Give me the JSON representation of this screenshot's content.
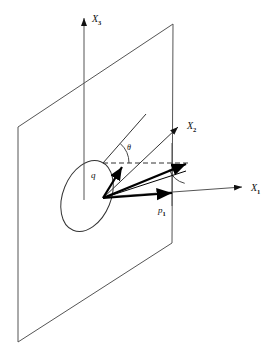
{
  "figure": {
    "background_color": "#ffffff",
    "line_color": "#444444",
    "vector_color": "#000000",
    "width": 276,
    "height": 361
  },
  "axes": [
    {
      "key": "x3",
      "name": "X3",
      "base": "X",
      "subscript": "3",
      "label_x": 92,
      "label_y": 22,
      "direction": "up",
      "from": [
        84,
        198
      ],
      "to": [
        84,
        14
      ],
      "arrow": true
    },
    {
      "key": "x2",
      "name": "X2",
      "base": "X",
      "subscript": "2",
      "label_x": 187,
      "label_y": 129,
      "direction": "up-right",
      "from": [
        103,
        198
      ],
      "to": [
        181,
        124
      ],
      "arrow": true
    },
    {
      "key": "x1",
      "name": "X1",
      "base": "X",
      "subscript": "1",
      "label_x": 253,
      "label_y": 191,
      "direction": "right",
      "from": [
        103,
        198
      ],
      "to": [
        246,
        187
      ],
      "arrow": true
    }
  ],
  "plane": {
    "name": "vertical-plane",
    "corners": [
      [
        18,
        127
      ],
      [
        173,
        24
      ],
      [
        172,
        243
      ],
      [
        18,
        342
      ]
    ],
    "stroke": "#555555",
    "fill": "none"
  },
  "ellipse": {
    "name": "origin-ellipse",
    "cx": 87,
    "cy": 196,
    "rx": 24,
    "ry": 37,
    "rotation_deg": 22,
    "stroke": "#333333"
  },
  "vectors": [
    {
      "key": "q",
      "label": "q",
      "label_x": 92,
      "label_y": 177,
      "from": [
        103,
        198
      ],
      "to": [
        124,
        164
      ],
      "weight": "thick",
      "arrow": true
    },
    {
      "key": "resultant",
      "label": "",
      "from": [
        103,
        198
      ],
      "to": [
        190,
        162
      ],
      "weight": "thick",
      "arrow": true
    },
    {
      "key": "p1",
      "label": "p1",
      "base": "p",
      "subscript": "1",
      "label_x": 160,
      "label_y": 212,
      "from": [
        103,
        198
      ],
      "to": [
        176,
        193
      ],
      "weight": "thick",
      "arrow": true
    },
    {
      "key": "secondary",
      "label": "",
      "from": [
        103,
        198
      ],
      "to": [
        186,
        171
      ],
      "weight": "thin",
      "arrow": false
    }
  ],
  "guides": [
    {
      "key": "dashed-horizontal",
      "name": "dashed-projection-line",
      "from": [
        103,
        163
      ],
      "to": [
        188,
        163
      ],
      "style": "dashed"
    },
    {
      "key": "theta-ray",
      "name": "theta-reference-ray",
      "from": [
        103,
        163
      ],
      "to": [
        146,
        114
      ],
      "style": "solid"
    },
    {
      "key": "vertical-drop",
      "name": "plane-right-edge-drop",
      "from": [
        172,
        143
      ],
      "to": [
        172,
        205
      ],
      "style": "solid"
    }
  ],
  "angles": [
    {
      "key": "theta",
      "label": "θ",
      "label_x": 129,
      "label_y": 148,
      "vertex": [
        103,
        163
      ],
      "radius": 26,
      "start_deg": -48,
      "end_deg": 0
    },
    {
      "key": "gamma",
      "label": "",
      "vertex": [
        190,
        162
      ],
      "radius": 22,
      "start_deg": 104,
      "end_deg": 160
    }
  ],
  "origin": {
    "name": "origin-point",
    "x": 103,
    "y": 198
  }
}
